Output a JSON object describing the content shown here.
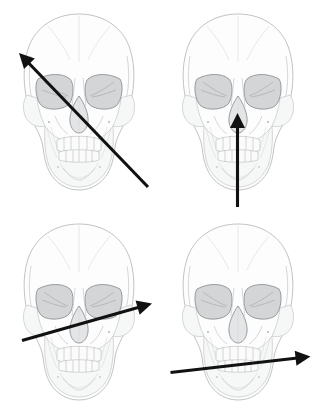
{
  "figure": {
    "background_color": "#ffffff",
    "width": 317,
    "height": 419,
    "layout": "2x2 grid",
    "arrow_color": "#111111",
    "skull_outline_color": "#b9bcbe",
    "orbit_fill_color": "#d3d5d6",
    "nasal_fill_color": "#e3e5e6"
  },
  "panels": [
    {
      "id": "top-left",
      "position": "top-left",
      "subject": "human skull, anterior (frontal) view",
      "arrow": {
        "name": "diagonal-up-left-arrow",
        "direction": "up-left",
        "tail": [
          148,
          187
        ],
        "tip": [
          19,
          53
        ],
        "angle_deg": 134,
        "description": "oblique arrow running from lower right jaw to upper left cranium"
      }
    },
    {
      "id": "top-right",
      "position": "top-right",
      "subject": "human skull, anterior (frontal) view",
      "arrow": {
        "name": "vertical-up-arrow",
        "direction": "up",
        "tail": [
          237,
          207
        ],
        "tip": [
          237,
          113
        ],
        "angle_deg": 90,
        "description": "vertical arrow running from chin up to the nasal aperture"
      }
    },
    {
      "id": "bottom-left",
      "position": "bottom-left",
      "subject": "human skull, anterior (frontal) view",
      "arrow": {
        "name": "shallow-up-right-arrow",
        "direction": "right and slightly up",
        "tail": [
          22,
          340
        ],
        "tip": [
          152,
          303
        ],
        "angle_deg": 16,
        "description": "shallow arrow crossing the midface from lower left to upper right"
      }
    },
    {
      "id": "bottom-right",
      "position": "bottom-right",
      "subject": "human skull, anterior (frontal) view",
      "arrow": {
        "name": "near-horizontal-right-arrow",
        "direction": "right",
        "tail": [
          170,
          372
        ],
        "tip": [
          310,
          356
        ],
        "angle_deg": 7,
        "description": "near-horizontal arrow crossing the mandible from left to right"
      }
    }
  ]
}
